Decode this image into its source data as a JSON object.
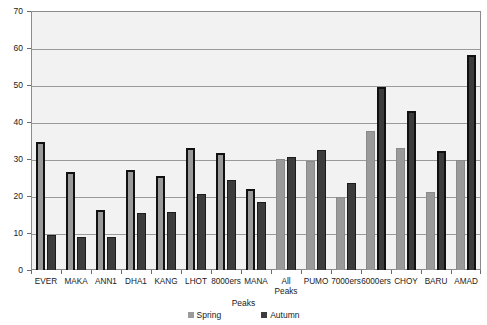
{
  "chart_data": {
    "type": "bar",
    "title": "",
    "subtitle": "",
    "xlabel": "",
    "ylabel": "",
    "ylim": [
      0,
      70
    ],
    "yticks": [
      0,
      10,
      20,
      30,
      40,
      50,
      60,
      70
    ],
    "ytick_labels": [
      "0",
      "10",
      "20",
      "30",
      "40",
      "50",
      "60",
      "70"
    ],
    "grid": true,
    "legend_position": "bottom",
    "legend_title": "Peaks",
    "categories": [
      "EVER",
      "MAKA",
      "ANN1",
      "DHA1",
      "KANG",
      "LHOT",
      "8000ers",
      "MANA",
      "All\nPeaks",
      "PUMO",
      "7000ers",
      "6000ers",
      "CHOY",
      "BARU",
      "AMAD"
    ],
    "series": [
      {
        "name": "Spring",
        "color": "#9a9a9a",
        "values": [
          34.5,
          26.5,
          16.3,
          27.0,
          25.3,
          33.0,
          31.5,
          22.0,
          30.0,
          29.5,
          19.8,
          37.5,
          33.0,
          21.0,
          29.8
        ]
      },
      {
        "name": "Autumn",
        "color": "#3c3c3c",
        "values": [
          9.5,
          9.0,
          8.8,
          15.5,
          15.7,
          20.5,
          24.3,
          18.5,
          30.5,
          32.5,
          23.5,
          49.5,
          43.0,
          32.3,
          58.0
        ]
      }
    ]
  },
  "colors": {
    "plot_background": "#f2f2f2",
    "gridline": "#9a9a9a",
    "axis": "#8c8c8c",
    "text": "#1a1a1a",
    "spring": "#9a9a9a",
    "autumn": "#3c3c3c"
  }
}
